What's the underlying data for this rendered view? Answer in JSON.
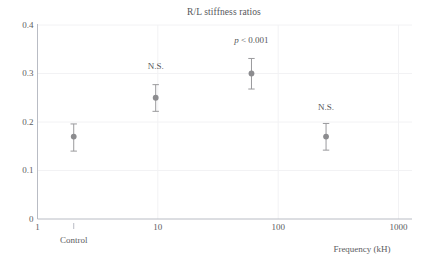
{
  "chart_data": {
    "type": "scatter",
    "title": "R/L stiffness ratios",
    "xlabel": "Frequency (kH)",
    "ylabel": "",
    "xscale": "log",
    "xlim": [
      1,
      1000
    ],
    "ylim": [
      0,
      0.4
    ],
    "grid": true,
    "legend": null,
    "x_tick_labels": [
      "1",
      "10",
      "100",
      "1000"
    ],
    "x_tick_values": [
      1,
      10,
      100,
      1000
    ],
    "y_tick_labels": [
      "0",
      "0.1",
      "0.2",
      "0.3",
      "0.4"
    ],
    "y_tick_values": [
      0,
      0.1,
      0.2,
      0.3,
      0.4
    ],
    "special_tick": {
      "label": "Control",
      "x_value": 2
    },
    "points": [
      {
        "label": "Control",
        "x": 2,
        "y": 0.17,
        "err_low": 0.14,
        "err_high": 0.196,
        "annotation": ""
      },
      {
        "label": "10 kHz",
        "x": 9.6,
        "y": 0.25,
        "err_low": 0.222,
        "err_high": 0.277,
        "annotation": "N.S."
      },
      {
        "label": "60 kHz",
        "x": 60,
        "y": 0.3,
        "err_low": 0.268,
        "err_high": 0.331,
        "annotation": "p < 0.001"
      },
      {
        "label": "250 kHz",
        "x": 250,
        "y": 0.17,
        "err_low": 0.142,
        "err_high": 0.197,
        "annotation": "N.S."
      }
    ],
    "annotations": [
      {
        "text": "N.S.",
        "x": 9.6,
        "y": 0.313
      },
      {
        "text": "p < 0.001",
        "x": 60,
        "y": 0.368,
        "italic_prefix": "p",
        "rest": " < 0.001"
      },
      {
        "text": "N.S.",
        "x": 250,
        "y": 0.228
      }
    ],
    "colors": {
      "marker": "#8c8c8f",
      "errorbar": "#9a9a9d",
      "axis": "#b9bcc4",
      "grid": "#f2f2f4",
      "text": "#55565a",
      "background": "#ffffff"
    }
  }
}
